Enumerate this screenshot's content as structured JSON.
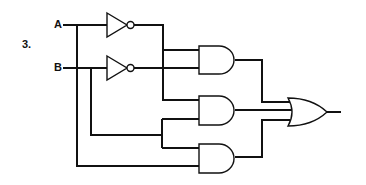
{
  "problem_number": "3.",
  "inputs": [
    {
      "label": "A"
    },
    {
      "label": "B"
    }
  ],
  "gates": [
    {
      "id": "not-a",
      "type": "NOT"
    },
    {
      "id": "not-b",
      "type": "NOT"
    },
    {
      "id": "and-1",
      "type": "AND"
    },
    {
      "id": "and-2",
      "type": "AND"
    },
    {
      "id": "and-3",
      "type": "AND"
    },
    {
      "id": "or-1",
      "type": "OR"
    }
  ],
  "colors": {
    "line": "#111111",
    "background": "#ffffff"
  }
}
